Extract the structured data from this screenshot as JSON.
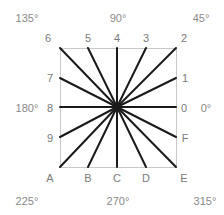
{
  "diagram": {
    "square": {
      "x": 60,
      "y": 48,
      "width": 116,
      "height": 119,
      "border_color": "#c8c8c8"
    },
    "center": {
      "x": 117,
      "y": 107
    },
    "ray_color": "#1a1a1a",
    "ray_endpoints": [
      {
        "id": "0",
        "x": 176,
        "y": 107
      },
      {
        "id": "1",
        "x": 176,
        "y": 78
      },
      {
        "id": "2",
        "x": 176,
        "y": 48
      },
      {
        "id": "3",
        "x": 146,
        "y": 48
      },
      {
        "id": "4",
        "x": 117,
        "y": 48
      },
      {
        "id": "5",
        "x": 88,
        "y": 48
      },
      {
        "id": "6",
        "x": 60,
        "y": 48
      },
      {
        "id": "7",
        "x": 60,
        "y": 78
      },
      {
        "id": "8",
        "x": 60,
        "y": 107
      },
      {
        "id": "9",
        "x": 60,
        "y": 137
      },
      {
        "id": "A",
        "x": 60,
        "y": 167
      },
      {
        "id": "B",
        "x": 88,
        "y": 167
      },
      {
        "id": "C",
        "x": 117,
        "y": 167
      },
      {
        "id": "D",
        "x": 146,
        "y": 167
      },
      {
        "id": "E",
        "x": 176,
        "y": 167
      },
      {
        "id": "F",
        "x": 176,
        "y": 137
      }
    ],
    "point_labels": [
      {
        "text": "6",
        "x": 48,
        "y": 38
      },
      {
        "text": "5",
        "x": 88,
        "y": 38
      },
      {
        "text": "4",
        "x": 117,
        "y": 38
      },
      {
        "text": "3",
        "x": 146,
        "y": 38
      },
      {
        "text": "2",
        "x": 184,
        "y": 38
      },
      {
        "text": "7",
        "x": 50,
        "y": 78
      },
      {
        "text": "1",
        "x": 185,
        "y": 78
      },
      {
        "text": "8",
        "x": 50,
        "y": 108
      },
      {
        "text": "0",
        "x": 184,
        "y": 108
      },
      {
        "text": "9",
        "x": 50,
        "y": 138
      },
      {
        "text": "F",
        "x": 185,
        "y": 138
      },
      {
        "text": "A",
        "x": 50,
        "y": 178
      },
      {
        "text": "B",
        "x": 88,
        "y": 178
      },
      {
        "text": "C",
        "x": 117,
        "y": 178
      },
      {
        "text": "D",
        "x": 146,
        "y": 178
      },
      {
        "text": "E",
        "x": 184,
        "y": 178
      }
    ],
    "angle_labels": [
      {
        "text": "135°",
        "x": 27,
        "y": 18
      },
      {
        "text": "90°",
        "x": 118,
        "y": 18
      },
      {
        "text": "45°",
        "x": 201,
        "y": 18
      },
      {
        "text": "180°",
        "x": 27,
        "y": 108
      },
      {
        "text": "0°",
        "x": 206,
        "y": 108
      },
      {
        "text": "225°",
        "x": 27,
        "y": 201
      },
      {
        "text": "270°",
        "x": 118,
        "y": 201
      },
      {
        "text": "315°",
        "x": 205,
        "y": 201
      }
    ]
  }
}
